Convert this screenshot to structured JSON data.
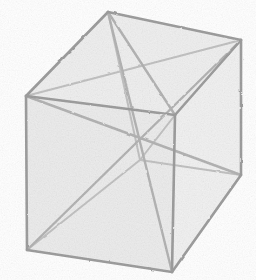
{
  "figure": {
    "kind": "line-drawing",
    "style": "hand-sketched perspective wireframe",
    "background_color": "#ffffff",
    "fill_color": "#eeeeee",
    "fill_color_alt": "#e8e8e8",
    "line_color": "#9e9e9e",
    "line_color_soft": "#b4b4b4",
    "line_color_faint": "#c2c2c2",
    "edge_width": 2.6,
    "diagonal_width": 2.4,
    "hidden_width": 2.0,
    "canvas": {
      "width": 256,
      "height": 280
    },
    "vertices": {
      "top_back": {
        "label": "top-back",
        "x": 108,
        "y": 12
      },
      "top_right_back": {
        "label": "top-right-back",
        "x": 241,
        "y": 40
      },
      "top_left_front": {
        "label": "top-left-front",
        "x": 26,
        "y": 96
      },
      "top_front": {
        "label": "top-front",
        "x": 175,
        "y": 115
      },
      "bottom_left": {
        "label": "bottom-left",
        "x": 27,
        "y": 250
      },
      "bottom_front": {
        "label": "bottom-front",
        "x": 172,
        "y": 272
      },
      "bottom_right": {
        "label": "bottom-right",
        "x": 241,
        "y": 175
      },
      "bottom_back": {
        "label": "bottom-back",
        "x": 140,
        "y": 160
      },
      "center": {
        "label": "center-crossing",
        "x": 140,
        "y": 137
      }
    },
    "faces": [
      {
        "name": "top-face",
        "points": "108,12 241,40 175,115 26,96",
        "fill": "#efefef"
      },
      {
        "name": "left-face",
        "points": "26,96 175,115 172,272 27,250",
        "fill": "#ececec"
      },
      {
        "name": "right-face",
        "points": "175,115 241,40 241,175 172,272",
        "fill": "#f1f1f1"
      }
    ],
    "edges": [
      {
        "name": "top-back-to-top-right",
        "x1": 108,
        "y1": 12,
        "x2": 241,
        "y2": 40,
        "hidden": false
      },
      {
        "name": "top-back-to-top-left",
        "x1": 108,
        "y1": 12,
        "x2": 26,
        "y2": 96,
        "hidden": false
      },
      {
        "name": "top-left-to-top-front",
        "x1": 26,
        "y1": 96,
        "x2": 175,
        "y2": 115,
        "hidden": false
      },
      {
        "name": "top-right-to-top-front",
        "x1": 241,
        "y1": 40,
        "x2": 175,
        "y2": 115,
        "hidden": false
      },
      {
        "name": "left-vertical-edge",
        "x1": 26,
        "y1": 96,
        "x2": 27,
        "y2": 250,
        "hidden": false
      },
      {
        "name": "front-vertical-edge",
        "x1": 175,
        "y1": 115,
        "x2": 172,
        "y2": 272,
        "hidden": false
      },
      {
        "name": "right-vertical-edge",
        "x1": 241,
        "y1": 40,
        "x2": 241,
        "y2": 175,
        "hidden": false
      },
      {
        "name": "bottom-left-to-front",
        "x1": 27,
        "y1": 250,
        "x2": 172,
        "y2": 272,
        "hidden": false
      },
      {
        "name": "bottom-front-to-right",
        "x1": 172,
        "y1": 272,
        "x2": 241,
        "y2": 175,
        "hidden": false
      },
      {
        "name": "hidden-back-vertical",
        "x1": 108,
        "y1": 12,
        "x2": 140,
        "y2": 160,
        "hidden": true
      },
      {
        "name": "hidden-bottom-back-left",
        "x1": 140,
        "y1": 160,
        "x2": 27,
        "y2": 250,
        "hidden": true
      },
      {
        "name": "hidden-bottom-back-right",
        "x1": 140,
        "y1": 160,
        "x2": 241,
        "y2": 175,
        "hidden": true
      }
    ],
    "diagonals": [
      {
        "name": "body-diagonal-topback-to-bottomfront",
        "x1": 108,
        "y1": 12,
        "x2": 172,
        "y2": 272,
        "hidden": false
      },
      {
        "name": "body-diagonal-topleft-to-bottomright",
        "x1": 26,
        "y1": 96,
        "x2": 241,
        "y2": 175,
        "hidden": false
      },
      {
        "name": "body-diagonal-topright-to-bottomleft",
        "x1": 241,
        "y1": 40,
        "x2": 27,
        "y2": 250,
        "hidden": false
      },
      {
        "name": "body-diagonal-topfront-to-bottomback",
        "x1": 175,
        "y1": 115,
        "x2": 140,
        "y2": 160,
        "hidden": true
      },
      {
        "name": "top-face-diagonal-left-to-right",
        "x1": 26,
        "y1": 96,
        "x2": 241,
        "y2": 40,
        "hidden": true
      },
      {
        "name": "top-face-diagonal-back-to-front",
        "x1": 108,
        "y1": 12,
        "x2": 175,
        "y2": 115,
        "hidden": false
      }
    ]
  }
}
